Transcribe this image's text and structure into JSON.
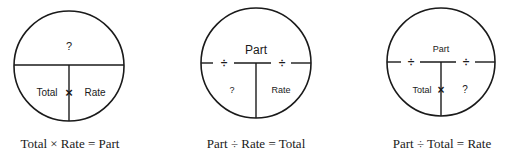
{
  "diagrams": [
    {
      "top": "?",
      "left": "Total",
      "operator": "×",
      "right": "Rate",
      "caption": "Total × Rate = Part",
      "divide_marks": false
    },
    {
      "top": "Part",
      "left": "?",
      "operator": "",
      "right": "Rate",
      "caption": "Part ÷ Rate = Total",
      "divide_marks": true,
      "divide_symbol": "÷"
    },
    {
      "top": "Part",
      "left": "Total",
      "operator": "×",
      "right": "?",
      "caption": "Part ÷ Total = Rate",
      "divide_marks": true,
      "divide_symbol": "÷"
    }
  ],
  "colors": {
    "stroke": "#1a1a1a",
    "background": "#ffffff"
  }
}
